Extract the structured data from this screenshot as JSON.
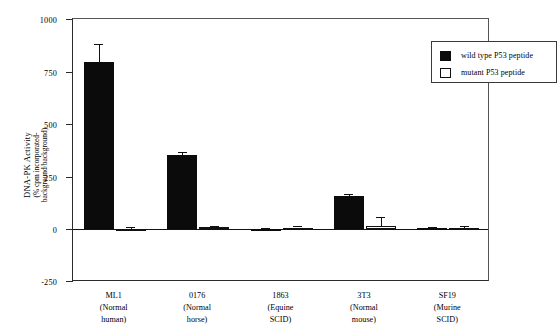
{
  "chart_data": {
    "type": "bar",
    "title": "",
    "xlabel": "",
    "ylabel_line1": "DNA-PK  Activity",
    "ylabel_line2": "(% cpm incorporated-",
    "ylabel_line3": "background/background)",
    "ylim": [
      -250,
      1000
    ],
    "yticks": [
      1000,
      750,
      500,
      250,
      0,
      -250
    ],
    "ytick_labels": [
      "1000",
      "750",
      "500",
      "250",
      "0",
      "-250"
    ],
    "grid": false,
    "legend_position": "top-right",
    "categories": [
      "ML1",
      "0176",
      "1863",
      "3T3",
      "SF19"
    ],
    "category_sublabels": [
      [
        "(Normal",
        "human)"
      ],
      [
        "(Normal",
        "horse)"
      ],
      [
        "(Equine",
        "SCID)"
      ],
      [
        "(Normal",
        "mouse)"
      ],
      [
        "(Murine",
        "SCID)"
      ]
    ],
    "series": [
      {
        "name": "wild type P53 peptide",
        "color": "#0b0b0b",
        "style": "filled",
        "values": [
          795,
          355,
          3,
          160,
          6
        ],
        "errors": [
          87,
          15,
          3,
          8,
          4
        ]
      },
      {
        "name": "mutant P53 peptide",
        "color": "#ffffff",
        "style": "open",
        "values": [
          -8,
          10,
          9,
          16,
          7
        ],
        "errors": [
          10,
          8,
          6,
          45,
          8
        ]
      }
    ]
  },
  "legend": {
    "items": [
      {
        "label": "wild type P53 peptide",
        "swatch": "filled-square-icon"
      },
      {
        "label": "mutant P53 peptide",
        "swatch": "open-square-icon"
      }
    ]
  },
  "axis": {
    "y_tick_0": "1000",
    "y_tick_1": "750",
    "y_tick_2": "500",
    "y_tick_3": "250",
    "y_tick_4": "0",
    "y_tick_5": "-250"
  },
  "xaxis": {
    "labels": [
      {
        "name": "ML1",
        "line2": "(Normal",
        "line3": "human)"
      },
      {
        "name": "0176",
        "line2": "(Normal",
        "line3": "horse)"
      },
      {
        "name": "1863",
        "line2": "(Equine",
        "line3": "SCID)"
      },
      {
        "name": "3T3",
        "line2": "(Normal",
        "line3": "mouse)"
      },
      {
        "name": "SF19",
        "line2": "(Murine",
        "line3": "SCID)"
      }
    ]
  }
}
